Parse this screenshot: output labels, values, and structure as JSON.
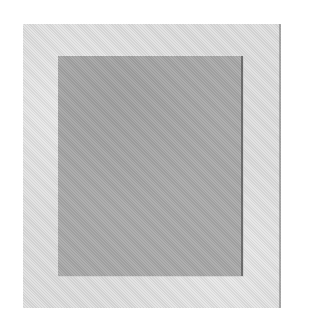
{
  "image": {
    "description": "gray-square-in-light-frame",
    "colors": {
      "background": "#ffffff",
      "frame": "#dcdcdc",
      "inner_square": "#a9a9a9"
    }
  }
}
